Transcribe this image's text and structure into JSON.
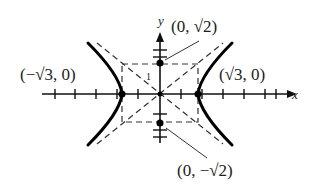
{
  "diagram": {
    "type": "hyperbola-graph",
    "axes": {
      "x_label": "x",
      "y_label": "y"
    },
    "tick_label": "1",
    "points": [
      {
        "name": "left-vertex",
        "label": "(−√3, 0)"
      },
      {
        "name": "right-vertex",
        "label": "(√3, 0)"
      },
      {
        "name": "top-point",
        "label": "(0, √2)"
      },
      {
        "name": "bottom-point",
        "label": "(0, −√2)"
      }
    ],
    "elements": [
      "hyperbola branches",
      "asymptotes (dashed)",
      "central rectangle (dashed)"
    ]
  }
}
